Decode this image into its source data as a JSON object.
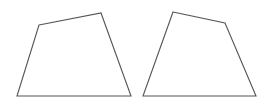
{
  "figure": {
    "canvas": {
      "width": 272,
      "height": 108,
      "background_color": "#ffffff"
    },
    "style": {
      "stroke_color": "#555555",
      "fill_color": "#ffffff",
      "stroke_width": 1.1
    },
    "shapes": [
      {
        "name": "left-quadrilateral",
        "kind": "quadrilateral",
        "points": "39,25 101,13 131,96 17,96",
        "vertices": [
          {
            "label": "top-left",
            "x": 39,
            "y": 25
          },
          {
            "label": "top-right",
            "x": 101,
            "y": 13
          },
          {
            "label": "bottom-right",
            "x": 131,
            "y": 96
          },
          {
            "label": "bottom-left",
            "x": 17,
            "y": 96
          }
        ]
      },
      {
        "name": "right-quadrilateral",
        "kind": "quadrilateral",
        "points": "173,12 225,23 256,96 143,96",
        "vertices": [
          {
            "label": "top-left",
            "x": 173,
            "y": 12
          },
          {
            "label": "top-right",
            "x": 225,
            "y": 23
          },
          {
            "label": "bottom-right",
            "x": 256,
            "y": 96
          },
          {
            "label": "bottom-left",
            "x": 143,
            "y": 96
          }
        ]
      }
    ]
  }
}
